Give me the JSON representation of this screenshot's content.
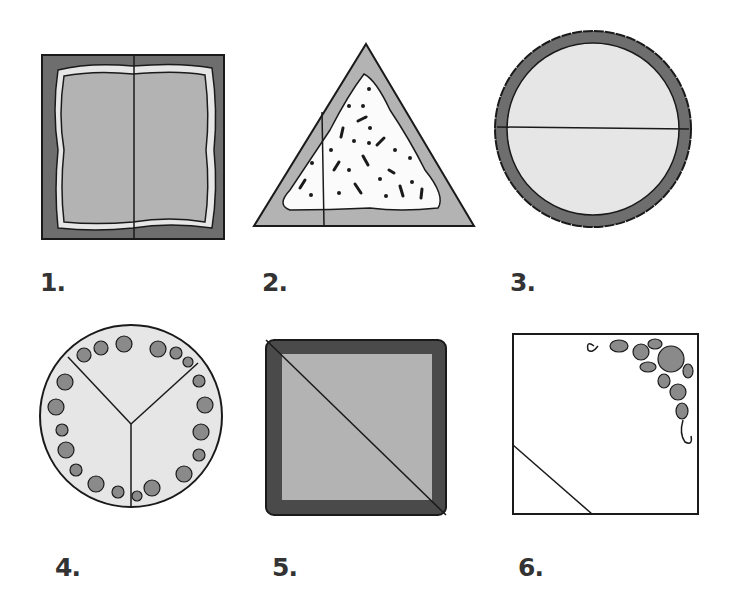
{
  "diagrams": [
    {
      "number": "1.",
      "shape": "square",
      "cut": "vertical-half",
      "decoration": "wavy-icing-border"
    },
    {
      "number": "2.",
      "shape": "triangle",
      "cut": "vertical-line",
      "decoration": "sprinkles"
    },
    {
      "number": "3.",
      "shape": "circle",
      "cut": "horizontal-half",
      "decoration": "scalloped-border"
    },
    {
      "number": "4.",
      "shape": "circle",
      "cut": "thirds",
      "decoration": "rose-border"
    },
    {
      "number": "5.",
      "shape": "square",
      "cut": "diagonal",
      "decoration": "piped-shell-border"
    },
    {
      "number": "6.",
      "shape": "square",
      "cut": "corner-triangle",
      "decoration": "rose-corner"
    }
  ],
  "colors": {
    "dark_gray": "#6e6e6e",
    "mid_gray": "#b3b3b3",
    "light_gray": "#e6e6e6",
    "white": "#ffffff",
    "outline": "#1a1a1a",
    "label": "#333333"
  }
}
